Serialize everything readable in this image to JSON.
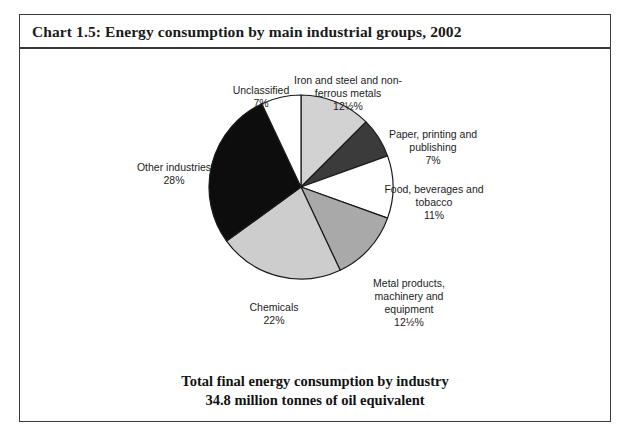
{
  "chart_title": "Chart 1.5: Energy consumption by main industrial groups, 2002",
  "footer": {
    "line1": "Total final energy consumption by industry",
    "line2": "34.8 million tonnes of oil equivalent"
  },
  "labels": {
    "iron": "Iron and steel and non-\nferrous metals",
    "iron_pct": "12½%",
    "paper": "Paper, printing and\npublishing",
    "paper_pct": "7%",
    "food": "Food, beverages and\ntobacco",
    "food_pct": "11%",
    "metal": "Metal products,\nmachinery and\nequipment",
    "metal_pct": "12½%",
    "chemicals": "Chemicals",
    "chemicals_pct": "22%",
    "other": "Other industries",
    "other_pct": "28%",
    "unclassified": "Unclassified",
    "unclassified_pct": "7%"
  },
  "chart_data": {
    "type": "pie",
    "title": "Chart 1.5: Energy consumption by main industrial groups, 2002",
    "subtitle": "Total final energy consumption by industry — 34.8 million tonnes of oil equivalent",
    "total_label": "34.8 million tonnes of oil equivalent",
    "unit": "million tonnes of oil equivalent",
    "total_value": 34.8,
    "legend": "none (direct labels)",
    "start_angle_deg": 0,
    "direction": "clockwise",
    "categories": [
      "Iron and steel and non-ferrous metals",
      "Paper, printing and publishing",
      "Food, beverages and tobacco",
      "Metal products, machinery and equipment",
      "Chemicals",
      "Other industries",
      "Unclassified"
    ],
    "values": [
      12.5,
      7,
      11,
      12.5,
      22,
      28,
      7
    ],
    "value_labels": [
      "12½%",
      "7%",
      "11%",
      "12½%",
      "22%",
      "28%",
      "7%"
    ],
    "colors": [
      "#d2d2d2",
      "#3b3b3b",
      "#ffffff",
      "#a9a9a9",
      "#cdcdcd",
      "#0d0d0d",
      "#ffffff"
    ],
    "stroke": "#1a1a1a"
  },
  "style": {
    "frame_border": "#3a3a3a",
    "text_color": "#1c1c1c",
    "background": "#ffffff"
  }
}
